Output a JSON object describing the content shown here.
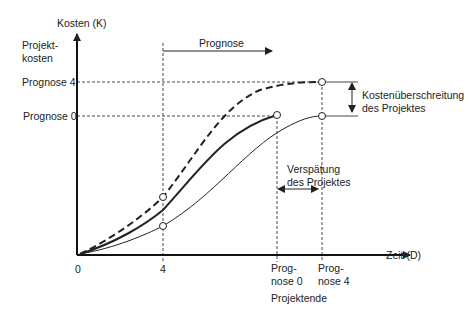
{
  "diagram": {
    "type": "cost-time-forecast",
    "y_axis": {
      "title": "Kosten (K)",
      "sublabel_line1": "Projekt-",
      "sublabel_line2": "kosten",
      "ticks": [
        {
          "label": "Prognose 4",
          "y": 82
        },
        {
          "label": "Prognose 0",
          "y": 116
        }
      ]
    },
    "x_axis": {
      "title": "Zeit (D)",
      "ticks": [
        {
          "label": "0"
        },
        {
          "label": "4"
        },
        {
          "label_line1": "Prog-",
          "label_line2": "nose 0"
        },
        {
          "label_line1": "Prog-",
          "label_line2": "nose 4"
        }
      ],
      "group_label": "Projektende"
    },
    "forecast_arrow": {
      "label": "Prognose"
    },
    "annotations": {
      "cost_overrun": {
        "line1": "Kostenüberschreitung",
        "line2": "des Projektes"
      },
      "delay": {
        "line1": "Verspätung",
        "line2": "des Projektes"
      }
    },
    "curves": [
      {
        "name": "Prognose 0 (plan)",
        "style": "bold solid"
      },
      {
        "name": "Prognose 4 actual progress",
        "style": "thin solid"
      },
      {
        "name": "Prognose 4 forecast costs",
        "style": "dashed"
      }
    ],
    "colors": {
      "line": "#222222",
      "background": "#ffffff"
    }
  }
}
